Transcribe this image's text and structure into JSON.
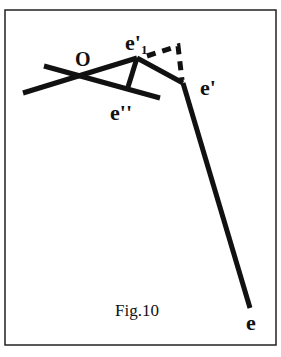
{
  "figure": {
    "caption": "Fig.10",
    "labels": {
      "origin": "O",
      "e1_prime": "e'",
      "e1_sub": "1",
      "e_prime": "e'",
      "e_double_prime": "e''",
      "e": "e"
    },
    "colors": {
      "stroke": "#111111",
      "background": "#ffffff"
    }
  }
}
